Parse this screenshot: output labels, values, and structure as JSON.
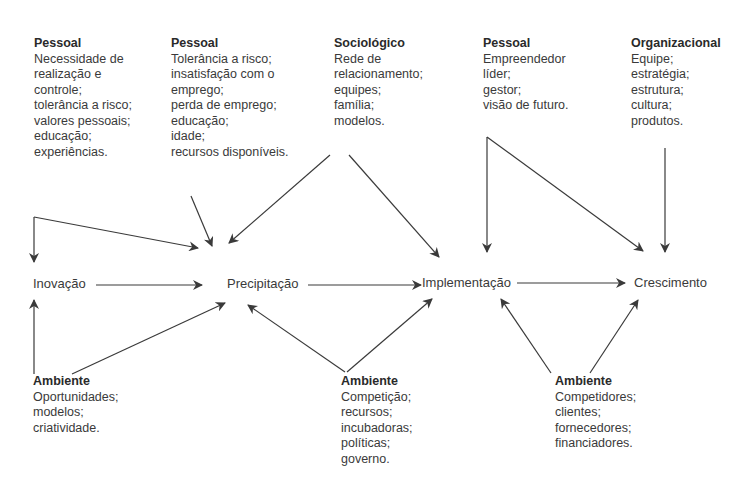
{
  "stages": [
    {
      "id": "inovacao",
      "label": "Inovação"
    },
    {
      "id": "precipitacao",
      "label": "Precipitação"
    },
    {
      "id": "implementacao",
      "label": "Implementação"
    },
    {
      "id": "crescimento",
      "label": "Crescimento"
    }
  ],
  "top_factors": [
    {
      "title": "Pessoal",
      "lines": [
        "Necessidade de",
        "realização e",
        "controle;",
        "tolerância a risco;",
        "valores pessoais;",
        "educação;",
        "experiências."
      ]
    },
    {
      "title": "Pessoal",
      "lines": [
        "Tolerância a risco;",
        "insatisfação com o",
        "emprego;",
        "perda de emprego;",
        "educação;",
        "idade;",
        "recursos disponíveis."
      ]
    },
    {
      "title": "Sociológico",
      "lines": [
        "Rede de",
        "relacionamento;",
        "equipes;",
        "família;",
        "modelos."
      ]
    },
    {
      "title": "Pessoal",
      "lines": [
        "Empreendedor",
        "líder;",
        "gestor;",
        "visão de futuro."
      ]
    },
    {
      "title": "Organizacional",
      "lines": [
        "Equipe;",
        "estratégia;",
        "estrutura;",
        "cultura;",
        "produtos."
      ]
    }
  ],
  "bottom_factors": [
    {
      "title": "Ambiente",
      "lines": [
        "Oportunidades;",
        "modelos;",
        "criatividade."
      ]
    },
    {
      "title": "Ambiente",
      "lines": [
        "Competição;",
        "recursos;",
        "incubadoras;",
        "políticas;",
        "governo."
      ]
    },
    {
      "title": "Ambiente",
      "lines": [
        "Competidores;",
        "clientes;",
        "fornecedores;",
        "financiadores."
      ]
    }
  ],
  "colors": {
    "line": "#3a3a3a",
    "text": "#3a3a3a",
    "background": "#ffffff"
  }
}
